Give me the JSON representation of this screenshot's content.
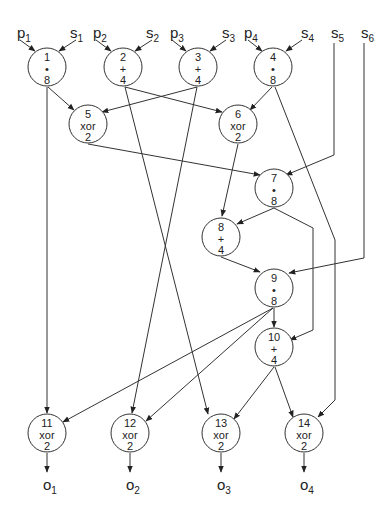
{
  "diagram": {
    "type": "dataflow-graph",
    "inputs": [
      {
        "id": "p1",
        "base": "p",
        "sub": "1",
        "x": 17,
        "y": 38
      },
      {
        "id": "s1",
        "base": "s",
        "sub": "1",
        "x": 70,
        "y": 38
      },
      {
        "id": "p2",
        "base": "p",
        "sub": "2",
        "x": 93,
        "y": 38
      },
      {
        "id": "s2",
        "base": "s",
        "sub": "2",
        "x": 146,
        "y": 38
      },
      {
        "id": "p3",
        "base": "p",
        "sub": "3",
        "x": 170,
        "y": 38
      },
      {
        "id": "s3",
        "base": "s",
        "sub": "3",
        "x": 222,
        "y": 38
      },
      {
        "id": "p4",
        "base": "p",
        "sub": "4",
        "x": 244,
        "y": 38
      },
      {
        "id": "s4",
        "base": "s",
        "sub": "4",
        "x": 301,
        "y": 38
      },
      {
        "id": "s5",
        "base": "s",
        "sub": "5",
        "x": 331,
        "y": 38
      },
      {
        "id": "s6",
        "base": "s",
        "sub": "6",
        "x": 361,
        "y": 38
      }
    ],
    "outputs": [
      {
        "id": "o1",
        "base": "o",
        "sub": "1",
        "x": 43,
        "y": 490
      },
      {
        "id": "o2",
        "base": "o",
        "sub": "2",
        "x": 126,
        "y": 490
      },
      {
        "id": "o3",
        "base": "o",
        "sub": "3",
        "x": 217,
        "y": 490
      },
      {
        "id": "o4",
        "base": "o",
        "sub": "4",
        "x": 300,
        "y": 490
      }
    ],
    "nodes": [
      {
        "id": "1",
        "op": "*",
        "width": "8",
        "cx": 47,
        "cy": 67
      },
      {
        "id": "2",
        "op": "+",
        "width": "4",
        "cx": 123,
        "cy": 67
      },
      {
        "id": "3",
        "op": "+",
        "width": "4",
        "cx": 198,
        "cy": 67
      },
      {
        "id": "4",
        "op": "*",
        "width": "8",
        "cx": 273,
        "cy": 67
      },
      {
        "id": "5",
        "op": "xor",
        "width": "2",
        "cx": 88,
        "cy": 124
      },
      {
        "id": "6",
        "op": "xor",
        "width": "2",
        "cx": 238,
        "cy": 124
      },
      {
        "id": "7",
        "op": "*",
        "width": "8",
        "cx": 274,
        "cy": 188
      },
      {
        "id": "8",
        "op": "+",
        "width": "4",
        "cx": 221,
        "cy": 237
      },
      {
        "id": "9",
        "op": "*",
        "width": "8",
        "cx": 274,
        "cy": 288
      },
      {
        "id": "10",
        "op": "+",
        "width": "4",
        "cx": 274,
        "cy": 347
      },
      {
        "id": "11",
        "op": "xor",
        "width": "2",
        "cx": 47,
        "cy": 433
      },
      {
        "id": "12",
        "op": "xor",
        "width": "2",
        "cx": 130,
        "cy": 433
      },
      {
        "id": "13",
        "op": "xor",
        "width": "2",
        "cx": 221,
        "cy": 433
      },
      {
        "id": "14",
        "op": "xor",
        "width": "2",
        "cx": 304,
        "cy": 433
      }
    ],
    "edges": [
      {
        "from": "p1",
        "to": "1"
      },
      {
        "from": "s1",
        "to": "1"
      },
      {
        "from": "p2",
        "to": "2"
      },
      {
        "from": "s2",
        "to": "2"
      },
      {
        "from": "p3",
        "to": "3"
      },
      {
        "from": "s3",
        "to": "3"
      },
      {
        "from": "p4",
        "to": "4"
      },
      {
        "from": "s4",
        "to": "4"
      },
      {
        "from": "1",
        "to": "5"
      },
      {
        "from": "1",
        "to": "11"
      },
      {
        "from": "2",
        "to": "6"
      },
      {
        "from": "2",
        "to": "13"
      },
      {
        "from": "3",
        "to": "5"
      },
      {
        "from": "3",
        "to": "12"
      },
      {
        "from": "4",
        "to": "6"
      },
      {
        "from": "4",
        "to": "14"
      },
      {
        "from": "5",
        "to": "7"
      },
      {
        "from": "s5",
        "to": "7"
      },
      {
        "from": "6",
        "to": "8"
      },
      {
        "from": "7",
        "to": "8"
      },
      {
        "from": "7",
        "to": "10"
      },
      {
        "from": "8",
        "to": "9"
      },
      {
        "from": "s6",
        "to": "9"
      },
      {
        "from": "9",
        "to": "10"
      },
      {
        "from": "9",
        "to": "11"
      },
      {
        "from": "9",
        "to": "12"
      },
      {
        "from": "10",
        "to": "13"
      },
      {
        "from": "10",
        "to": "14"
      },
      {
        "from": "11",
        "to": "o1"
      },
      {
        "from": "12",
        "to": "o2"
      },
      {
        "from": "13",
        "to": "o3"
      },
      {
        "from": "14",
        "to": "o4"
      }
    ]
  }
}
